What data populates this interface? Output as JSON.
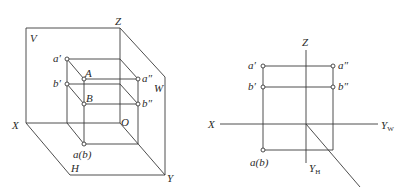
{
  "figure_left": {
    "title": "three-plane projection (pictorial)",
    "labels": {
      "V": "V",
      "W": "W",
      "H": "H",
      "Z": "Z",
      "X": "X",
      "Y": "Y",
      "O": "O",
      "a_prime": "a′",
      "b_prime": "b′",
      "A": "A",
      "B": "B",
      "a_dprime": "a″",
      "b_dprime": "b″",
      "ab": "a(b)"
    }
  },
  "figure_right": {
    "title": "three-view projection (unfolded)",
    "labels": {
      "Z": "Z",
      "X": "X",
      "Yw": "Y",
      "Yw_sub": "W",
      "Yh": "Y",
      "Yh_sub": "H",
      "a_prime": "a′",
      "b_prime": "b′",
      "a_dprime": "a″",
      "b_dprime": "b″",
      "ab": "a(b)"
    }
  },
  "colors": {
    "line": "#3a3a3a",
    "text": "#2a2a2a",
    "background": "#ffffff"
  }
}
